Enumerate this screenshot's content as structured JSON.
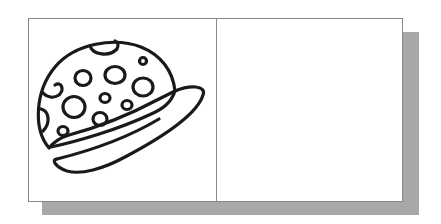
{
  "figure": {
    "panels": [
      {
        "id": "left",
        "content": "hat-drawing",
        "description": "Line drawing of a polka-dot cap with a brim"
      },
      {
        "id": "right",
        "content": "blank",
        "description": "Empty panel"
      }
    ],
    "colors": {
      "frame_border": "#8a8a8a",
      "shadow": "#a8a8a8",
      "stroke": "#1a1a1a",
      "background": "#ffffff"
    }
  }
}
